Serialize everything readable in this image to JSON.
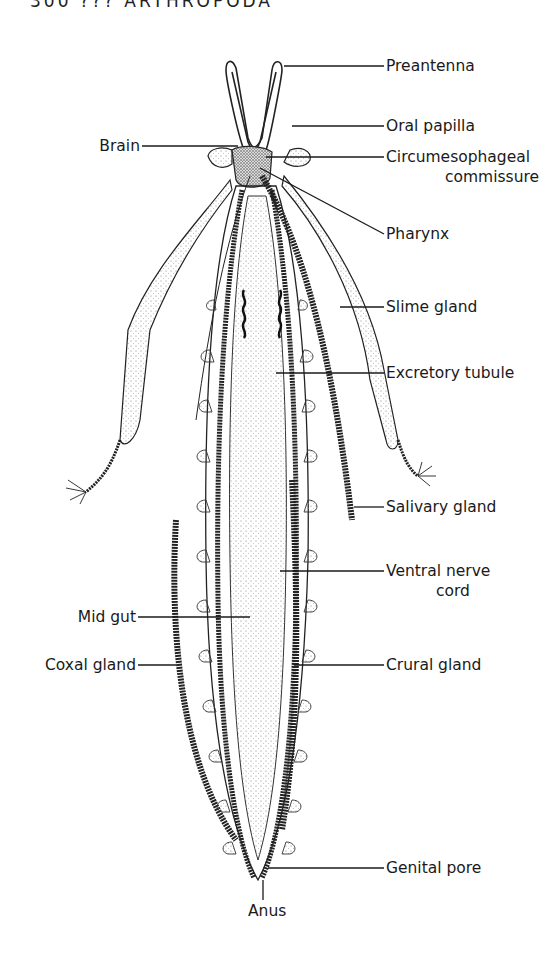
{
  "header": {
    "text": "300   ???   ARTHROPODA"
  },
  "figure": {
    "labels_right": [
      {
        "id": "preantenna",
        "text": "Preantenna"
      },
      {
        "id": "oral-papilla",
        "text": "Oral papilla"
      },
      {
        "id": "circumesophageal",
        "text": "Circumesophageal",
        "text2": "commissure"
      },
      {
        "id": "pharynx",
        "text": "Pharynx"
      },
      {
        "id": "slime-gland",
        "text": "Slime gland"
      },
      {
        "id": "excretory-tubule",
        "text": "Excretory tubule"
      },
      {
        "id": "salivary-gland",
        "text": "Salivary gland"
      },
      {
        "id": "ventral-nerve-cord",
        "text": "Ventral nerve",
        "text2": "cord"
      },
      {
        "id": "crural-gland",
        "text": "Crural gland"
      },
      {
        "id": "genital-pore",
        "text": "Genital pore"
      }
    ],
    "labels_left": [
      {
        "id": "brain",
        "text": "Brain"
      },
      {
        "id": "mid-gut",
        "text": "Mid gut"
      },
      {
        "id": "coxal-gland",
        "text": "Coxal gland"
      }
    ],
    "labels_bottom": [
      {
        "id": "anus",
        "text": "Anus"
      }
    ]
  }
}
